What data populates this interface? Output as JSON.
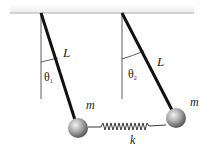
{
  "diagram": {
    "labels": {
      "length_left": "L",
      "length_right": "L",
      "angle_left": "θ",
      "angle_left_sub": "1",
      "angle_right": "θ",
      "angle_right_sub": "2",
      "mass_left": "m",
      "mass_right": "m",
      "spring_constant": "k"
    },
    "colors": {
      "ceiling": "#b8b8b8",
      "rod": "#111111",
      "reference_line": "#333333",
      "spring": "#222222",
      "ball_light": "#eeeeee",
      "ball_dark": "#555555"
    }
  }
}
